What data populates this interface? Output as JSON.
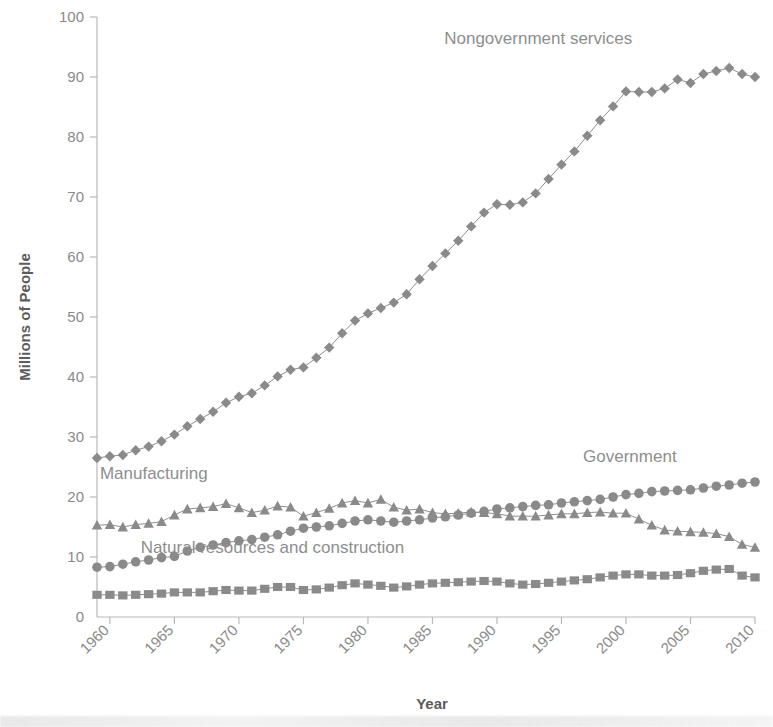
{
  "chart_data": {
    "type": "line",
    "title": "",
    "xlabel": "Year",
    "ylabel": "Millions of People",
    "xlim": [
      1959,
      2010
    ],
    "ylim": [
      0,
      100
    ],
    "grid": false,
    "legend_position": "inline-annotations",
    "xticks": [
      "1960",
      "1965",
      "1970",
      "1975",
      "1980",
      "1985",
      "1990",
      "1995",
      "2000",
      "2005",
      "2010"
    ],
    "yticks": [
      "0",
      "10",
      "20",
      "30",
      "40",
      "50",
      "60",
      "70",
      "80",
      "90",
      "100"
    ],
    "x": [
      1959,
      1960,
      1961,
      1962,
      1963,
      1964,
      1965,
      1966,
      1967,
      1968,
      1969,
      1970,
      1971,
      1972,
      1973,
      1974,
      1975,
      1976,
      1977,
      1978,
      1979,
      1980,
      1981,
      1982,
      1983,
      1984,
      1985,
      1986,
      1987,
      1988,
      1989,
      1990,
      1991,
      1992,
      1993,
      1994,
      1995,
      1996,
      1997,
      1998,
      1999,
      2000,
      2001,
      2002,
      2003,
      2004,
      2005,
      2006,
      2007,
      2008,
      2009,
      2010
    ],
    "series": [
      {
        "name": "Nongovernment services",
        "marker": "diamond",
        "color": "#8a8a8a",
        "label_x": 1993.2,
        "label_y": 95.5,
        "values": [
          26.5,
          26.8,
          27.0,
          27.8,
          28.4,
          29.3,
          30.4,
          31.8,
          33.0,
          34.2,
          35.7,
          36.7,
          37.3,
          38.6,
          40.1,
          41.2,
          41.6,
          43.2,
          44.9,
          47.3,
          49.4,
          50.6,
          51.5,
          52.4,
          53.8,
          56.3,
          58.5,
          60.6,
          62.7,
          65.1,
          67.4,
          68.8,
          68.7,
          69.1,
          70.6,
          73.0,
          75.4,
          77.6,
          80.2,
          82.8,
          85.1,
          87.6,
          87.5,
          87.5,
          88.1,
          89.6,
          89.0,
          90.5,
          91.0,
          91.5,
          90.5,
          90.0
        ]
      },
      {
        "name": "Manufacturing",
        "marker": "triangle",
        "color": "#8a8a8a",
        "label_x": 1963.4,
        "label_y": 23.0,
        "values": [
          15.3,
          15.4,
          15.0,
          15.4,
          15.6,
          15.9,
          17.0,
          18.0,
          18.2,
          18.4,
          18.9,
          18.2,
          17.4,
          17.8,
          18.5,
          18.3,
          16.8,
          17.4,
          18.1,
          19.0,
          19.4,
          19.0,
          19.6,
          18.3,
          17.8,
          18.0,
          17.4,
          17.2,
          17.3,
          17.5,
          17.4,
          17.2,
          16.8,
          16.8,
          16.8,
          17.0,
          17.2,
          17.2,
          17.4,
          17.5,
          17.3,
          17.3,
          16.3,
          15.3,
          14.5,
          14.3,
          14.2,
          14.1,
          13.9,
          13.4,
          12.1,
          11.6
        ]
      },
      {
        "name": "Government",
        "marker": "circle",
        "color": "#8a8a8a",
        "label_x": 2000.3,
        "label_y": 25.8,
        "values": [
          8.3,
          8.4,
          8.8,
          9.2,
          9.5,
          9.9,
          10.1,
          11.0,
          11.6,
          12.0,
          12.4,
          12.7,
          12.9,
          13.3,
          13.7,
          14.3,
          14.8,
          15.0,
          15.2,
          15.6,
          16.0,
          16.2,
          16.0,
          15.8,
          16.0,
          16.2,
          16.5,
          16.7,
          17.0,
          17.3,
          17.6,
          18.0,
          18.2,
          18.4,
          18.6,
          18.7,
          19.0,
          19.2,
          19.4,
          19.6,
          20.0,
          20.4,
          20.6,
          20.9,
          21.0,
          21.1,
          21.2,
          21.5,
          21.8,
          22.0,
          22.3,
          22.5
        ]
      },
      {
        "name": "Natural resources and construction",
        "marker": "square",
        "color": "#8a8a8a",
        "label_x": 1972.6,
        "label_y": 10.6,
        "values": [
          3.7,
          3.7,
          3.6,
          3.7,
          3.8,
          3.9,
          4.1,
          4.1,
          4.1,
          4.3,
          4.5,
          4.4,
          4.4,
          4.7,
          5.0,
          5.0,
          4.5,
          4.6,
          4.9,
          5.3,
          5.6,
          5.4,
          5.2,
          4.9,
          5.1,
          5.4,
          5.6,
          5.7,
          5.8,
          5.9,
          6.0,
          5.9,
          5.6,
          5.4,
          5.5,
          5.7,
          5.9,
          6.1,
          6.3,
          6.6,
          6.9,
          7.1,
          7.1,
          6.9,
          6.9,
          7.0,
          7.3,
          7.7,
          7.9,
          8.0,
          6.9,
          6.6
        ]
      }
    ]
  }
}
